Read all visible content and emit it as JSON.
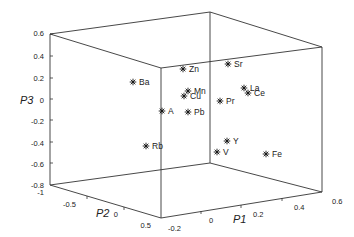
{
  "chart_data": {
    "type": "scatter3d",
    "title": "",
    "xlabel": "P1",
    "ylabel": "P2",
    "zlabel": "P3",
    "xlim": [
      -0.2,
      0.6
    ],
    "ylim": [
      -1,
      0.5
    ],
    "zlim": [
      -0.8,
      0.6
    ],
    "grid": false,
    "marker": "asterisk",
    "x_ticks": [
      "-0.2",
      "0",
      "0.2",
      "0.4",
      "0.6"
    ],
    "y_ticks": [
      "-1",
      "-0.5",
      "0",
      "0.5"
    ],
    "z_ticks": [
      "0.6",
      "0.4",
      "0.2",
      "0",
      "-0.2",
      "-0.4",
      "-0.6",
      "-0.8"
    ],
    "points": [
      {
        "label": "Ba",
        "P1": -0.15,
        "P2": -0.45,
        "P3": 0.2,
        "sx": 133,
        "sy": 82
      },
      {
        "label": "Zn",
        "P1": 0.05,
        "P2": -0.4,
        "P3": 0.33,
        "sx": 183,
        "sy": 69
      },
      {
        "label": "Sr",
        "P1": 0.2,
        "P2": -0.5,
        "P3": 0.35,
        "sx": 228,
        "sy": 64
      },
      {
        "label": "Mn",
        "P1": 0.05,
        "P2": -0.35,
        "P3": 0.1,
        "sx": 188,
        "sy": 91
      },
      {
        "label": "Cu",
        "P1": 0.05,
        "P2": -0.4,
        "P3": 0.05,
        "sx": 184,
        "sy": 96
      },
      {
        "label": "La",
        "P1": 0.3,
        "P2": -0.4,
        "P3": 0.12,
        "sx": 244,
        "sy": 88
      },
      {
        "label": "Ce",
        "P1": 0.3,
        "P2": -0.35,
        "P3": 0.08,
        "sx": 248,
        "sy": 93
      },
      {
        "label": "Pr",
        "P1": 0.2,
        "P2": -0.3,
        "P3": 0.0,
        "sx": 220,
        "sy": 101
      },
      {
        "label": "A",
        "P1": -0.05,
        "P2": -0.3,
        "P3": -0.1,
        "sx": 162,
        "sy": 111
      },
      {
        "label": "Pb",
        "P1": 0.05,
        "P2": -0.25,
        "P3": -0.1,
        "sx": 188,
        "sy": 112
      },
      {
        "label": "Rb",
        "P1": -0.1,
        "P2": -0.1,
        "P3": -0.4,
        "sx": 146,
        "sy": 146
      },
      {
        "label": "Y",
        "P1": 0.2,
        "P2": -0.1,
        "P3": -0.38,
        "sx": 227,
        "sy": 141
      },
      {
        "label": "V",
        "P1": 0.15,
        "P2": 0.0,
        "P3": -0.45,
        "sx": 217,
        "sy": 152
      },
      {
        "label": "Fe",
        "P1": 0.4,
        "P2": -0.1,
        "P3": -0.5,
        "sx": 266,
        "sy": 154
      }
    ]
  },
  "axes_screen": {
    "z_ticks": [
      {
        "label": "0.6",
        "x": 44,
        "y": 33
      },
      {
        "label": "0.4",
        "x": 44,
        "y": 56
      },
      {
        "label": "0.2",
        "x": 44,
        "y": 78
      },
      {
        "label": "0",
        "x": 44,
        "y": 100
      },
      {
        "label": "-0.2",
        "x": 44,
        "y": 121
      },
      {
        "label": "-0.4",
        "x": 44,
        "y": 143
      },
      {
        "label": "-0.6",
        "x": 44,
        "y": 164
      },
      {
        "label": "-0.8",
        "x": 44,
        "y": 185
      }
    ],
    "y_ticks": [
      {
        "label": "-1",
        "x": 44,
        "y": 192
      },
      {
        "label": "-0.5",
        "x": 76,
        "y": 204
      },
      {
        "label": "0",
        "x": 118,
        "y": 214
      },
      {
        "label": "0.5",
        "x": 151,
        "y": 225
      }
    ],
    "x_ticks": [
      {
        "label": "-0.2",
        "x": 168,
        "y": 228
      },
      {
        "label": "0",
        "x": 209,
        "y": 220
      },
      {
        "label": "0.2",
        "x": 253,
        "y": 214
      },
      {
        "label": "0.4",
        "x": 294,
        "y": 207
      },
      {
        "label": "0.6",
        "x": 332,
        "y": 201
      }
    ],
    "xlabel_pos": {
      "x": 233,
      "y": 223
    },
    "ylabel_pos": {
      "x": 96,
      "y": 217
    },
    "zlabel_pos": {
      "x": 20,
      "y": 104
    }
  }
}
